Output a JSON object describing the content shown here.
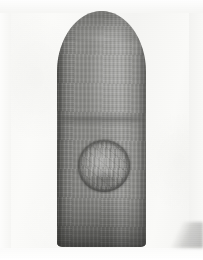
{
  "image": {
    "type": "clinical-photograph",
    "color_mode": "grayscale",
    "width_px": 203,
    "height_px": 260,
    "caption": "Close-up grayscale photograph of a fingertip showing a well-circumscribed round raised lesion on the volar pad of the distal phalanx",
    "subject": "fingertip",
    "orientation": "vertical, fingertip pointing up"
  },
  "background": {
    "name": "plain pale backdrop",
    "color": "#f6f6f4",
    "highlight_color": "#fefefe",
    "shadow_color": "#78787 6"
  },
  "finger": {
    "name": "index finger, distal segment",
    "skin_tone_midtone": "#888885",
    "skin_tone_highlight": "#a9a9a6",
    "skin_tone_shadow": "#5a5a58",
    "bounds": {
      "x": 57,
      "y": 11,
      "width": 89,
      "height": 236
    },
    "features": [
      "rounded fingertip dome at top",
      "fingerprint ridge texture",
      "interphalangeal flexion crease",
      "darker shading toward the base"
    ],
    "crease": {
      "label": "distal interphalangeal crease",
      "y": 125
    }
  },
  "lesion": {
    "name": "circular cutaneous lesion",
    "description": "round, sharply demarcated, slightly elevated plaque with a darker annular rim and finely striated surface",
    "shape": "circular",
    "center_x": 104,
    "center_y": 166,
    "diameter_px": 52,
    "rim_color": "#303030",
    "surface_color": "#8d8d8a",
    "border": "well-defined annular ring"
  },
  "annotations": {
    "labels": [],
    "scale_bar": null,
    "arrows": []
  }
}
